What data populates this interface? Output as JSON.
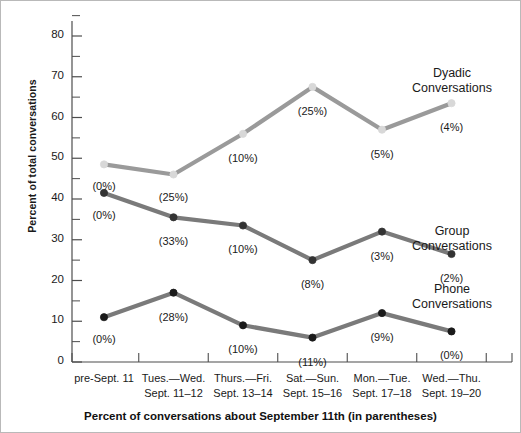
{
  "chart_data": {
    "type": "line",
    "title": "",
    "xlabel": "Percent of conversations about September 11th (in parentheses)",
    "ylabel": "Percent of total conversations",
    "categories": [
      "pre-Sept. 11",
      "Tues. — Wed. Sept. 11–12",
      "Thurs. — Fri. Sept. 13–14",
      "Sat. — Sun. Sept. 15–16",
      "Mon. — Tue. Sept. 17–18",
      "Wed. — Thu. Sept. 19–20"
    ],
    "category_lines": [
      [
        "pre-Sept. 11",
        ""
      ],
      [
        "Tues.—Wed.",
        "Sept. 11–12"
      ],
      [
        "Thurs.—Fri.",
        "Sept. 13–14"
      ],
      [
        "Sat.—Sun.",
        "Sept. 15–16"
      ],
      [
        "Mon.—Tue.",
        "Sept. 17–18"
      ],
      [
        "Wed.—Thu.",
        "Sept. 19–20"
      ]
    ],
    "ylim": [
      0,
      85
    ],
    "yticks": [
      0,
      10,
      20,
      30,
      40,
      50,
      60,
      70,
      80
    ],
    "yticks_minor": [
      5,
      15,
      25,
      35,
      45,
      55,
      65,
      75
    ],
    "grid": false,
    "legend_position": "right-inline",
    "series": [
      {
        "name": "Dyadic Conversations",
        "label_lines": [
          "Dyadic",
          "Conversations"
        ],
        "color": "#9a9a9a",
        "marker_color": "#d8d8d8",
        "values": [
          48.5,
          46,
          56,
          67.5,
          57,
          63.5
        ],
        "point_labels": [
          "(0%)",
          "(25%)",
          "(10%)",
          "(25%)",
          "(5%)",
          "(4%)"
        ]
      },
      {
        "name": "Group Conversations",
        "label_lines": [
          "Group",
          "Conversations"
        ],
        "color": "#7a7a7a",
        "marker_color": "#333333",
        "values": [
          41.5,
          35.5,
          33.5,
          25,
          32,
          26.5
        ],
        "point_labels": [
          "(0%)",
          "(33%)",
          "(10%)",
          "(8%)",
          "(3%)",
          "(2%)"
        ]
      },
      {
        "name": "Phone Conversations",
        "label_lines": [
          "Phone",
          "Conversations"
        ],
        "color": "#7a7a7a",
        "marker_color": "#1a1a1a",
        "values": [
          11,
          17,
          9,
          6,
          12,
          7.5
        ],
        "point_labels": [
          "(0%)",
          "(28%)",
          "(10%)",
          "(11%)",
          "(9%)",
          "(0%)"
        ]
      }
    ]
  },
  "colors": {
    "axis": "#4d4d4d",
    "text": "#1a1a1a",
    "frame": "#b9b9b9"
  }
}
